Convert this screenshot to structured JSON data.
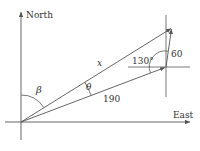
{
  "diagram": {
    "axes": {
      "north_label": "North",
      "east_label": "East"
    },
    "labels": {
      "x": "x",
      "side_190": "190",
      "side_60": "60",
      "angle_130": "130°",
      "theta": "θ",
      "beta": "β"
    },
    "colors": {
      "line": "#555555",
      "text": "#333333",
      "background": "#ffffff"
    }
  }
}
